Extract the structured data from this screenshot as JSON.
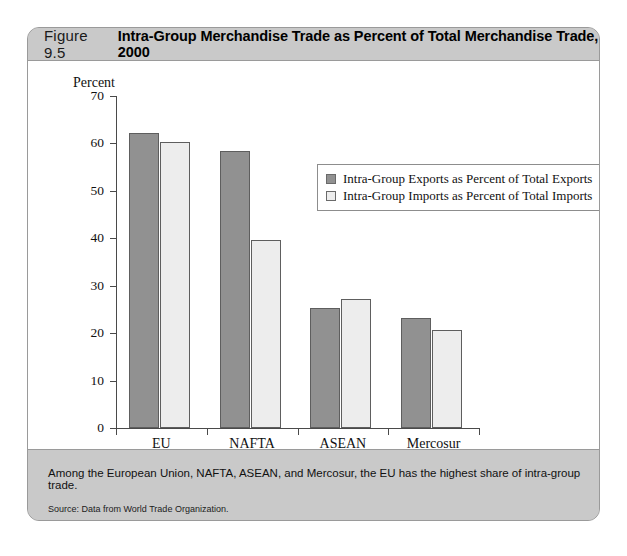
{
  "figure": {
    "number": "Figure 9.5",
    "title": "Intra-Group Merchandise Trade as Percent of Total Merchandise Trade, 2000",
    "caption": "Among the European Union, NAFTA, ASEAN, and Mercosur, the EU has the highest share of intra-group trade.",
    "source": "Source: Data from World Trade Organization."
  },
  "chart_data": {
    "type": "bar",
    "title": "Intra-Group Merchandise Trade as Percent of Total Merchandise Trade, 2000",
    "categories": [
      "EU",
      "NAFTA",
      "ASEAN",
      "Mercosur"
    ],
    "series": [
      {
        "name": "Intra-Group Exports as Percent of Total Exports",
        "values": [
          62.3,
          58.4,
          25.3,
          23.2
        ],
        "color": "#919191"
      },
      {
        "name": "Intra-Group Imports as Percent of Total Imports",
        "values": [
          60.2,
          39.6,
          27.2,
          20.7
        ],
        "color": "#ededed"
      }
    ],
    "xlabel": "",
    "ylabel": "Percent",
    "ylim": [
      0,
      70
    ],
    "yticks": [
      0,
      10,
      20,
      30,
      40,
      50,
      60,
      70
    ],
    "ytick_labels": [
      "0",
      "10",
      "20",
      "30",
      "40",
      "50",
      "60",
      "70"
    ],
    "grid": false,
    "legend_position": "upper right"
  }
}
